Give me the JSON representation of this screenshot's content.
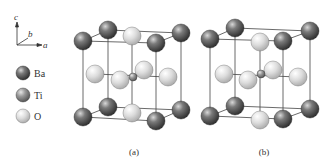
{
  "figure": {
    "axes": {
      "c": "c",
      "b": "b",
      "a": "a"
    },
    "legend": [
      {
        "element": "Ba",
        "label": "Ba",
        "color": "dark"
      },
      {
        "element": "Ti",
        "label": "Ti",
        "color": "medium"
      },
      {
        "element": "O",
        "label": "O",
        "color": "light"
      }
    ],
    "panels": [
      {
        "caption": "(a)",
        "description": "BaTiO3 perovskite unit cell, Ti centered"
      },
      {
        "caption": "(b)",
        "description": "BaTiO3 perovskite unit cell, Ti displaced"
      }
    ]
  }
}
